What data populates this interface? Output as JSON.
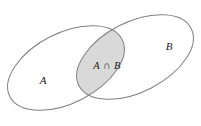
{
  "figure": {
    "name": "venn-diagram-two-sets",
    "background_color": "#ffffff",
    "width": 201,
    "height": 126
  },
  "style": {
    "outline_color": "#808080",
    "outline_width": 1,
    "intersection_fill": "#d9d9d9",
    "label_color": "#222222"
  },
  "sets": {
    "left": {
      "label": "A",
      "label_x": 43,
      "label_y": 81,
      "cx": 66,
      "cy": 68,
      "rx": 63,
      "ry": 35,
      "rotation": -27
    },
    "right": {
      "label": "B",
      "label_x": 169,
      "label_y": 47,
      "cx": 135,
      "cy": 57,
      "rx": 63,
      "ry": 35,
      "rotation": -27
    }
  },
  "intersection": {
    "label": "A ∩ B",
    "label_x": 107,
    "label_y": 67,
    "fill": "#d9d9d9"
  }
}
